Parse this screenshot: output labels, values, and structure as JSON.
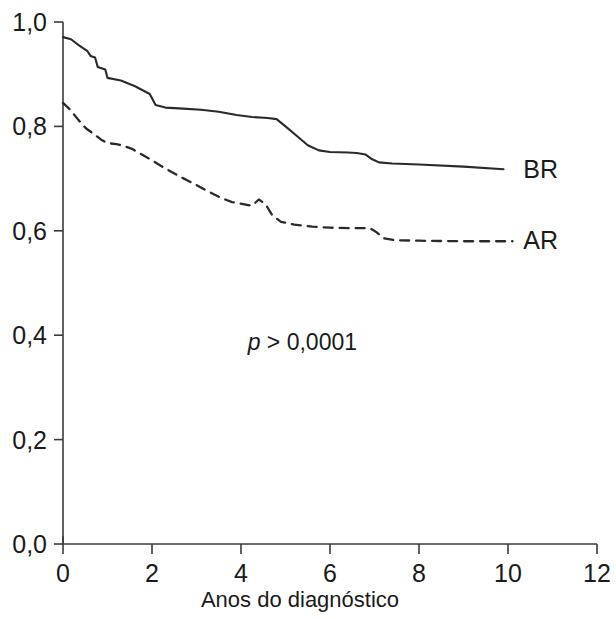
{
  "chart_data": {
    "type": "line",
    "title": "",
    "subtitle": "",
    "xlabel": "Anos do diagnóstico",
    "ylabel": "",
    "xlim": [
      0,
      12
    ],
    "ylim": [
      0.0,
      1.0
    ],
    "grid": false,
    "legend_position": "right-of-curve-end",
    "xticks": [
      0,
      2,
      4,
      6,
      8,
      10,
      12
    ],
    "xtick_labels": [
      "0",
      "2",
      "4",
      "6",
      "8",
      "10",
      "12"
    ],
    "yticks": [
      0.0,
      0.2,
      0.4,
      0.6,
      0.8,
      1.0
    ],
    "ytick_labels": [
      "0,0",
      "0,2",
      "0,4",
      "0,6",
      "0,8",
      "1,0"
    ],
    "annotations": [
      {
        "name": "p-value",
        "italic_prefix": "p",
        "text": " > 0,0001",
        "full_text": "p > 0,0001",
        "x": 4.15,
        "y": 0.372
      }
    ],
    "series": [
      {
        "name": "BR",
        "label": "BR",
        "style": "solid",
        "color": "#2a2a2a",
        "label_x": 10.05,
        "label_y": 0.718,
        "points": [
          [
            0.0,
            0.971
          ],
          [
            0.18,
            0.967
          ],
          [
            0.36,
            0.955
          ],
          [
            0.55,
            0.944
          ],
          [
            0.62,
            0.935
          ],
          [
            0.72,
            0.932
          ],
          [
            0.78,
            0.914
          ],
          [
            0.95,
            0.909
          ],
          [
            1.0,
            0.893
          ],
          [
            1.3,
            0.888
          ],
          [
            1.62,
            0.877
          ],
          [
            1.95,
            0.862
          ],
          [
            2.08,
            0.841
          ],
          [
            2.3,
            0.836
          ],
          [
            2.7,
            0.834
          ],
          [
            3.1,
            0.832
          ],
          [
            3.5,
            0.828
          ],
          [
            3.9,
            0.822
          ],
          [
            4.25,
            0.818
          ],
          [
            4.6,
            0.816
          ],
          [
            4.8,
            0.814
          ],
          [
            5.0,
            0.8
          ],
          [
            5.25,
            0.782
          ],
          [
            5.5,
            0.764
          ],
          [
            5.75,
            0.754
          ],
          [
            6.0,
            0.751
          ],
          [
            6.4,
            0.75
          ],
          [
            6.6,
            0.749
          ],
          [
            6.8,
            0.746
          ],
          [
            6.95,
            0.737
          ],
          [
            7.1,
            0.731
          ],
          [
            7.4,
            0.729
          ],
          [
            8.0,
            0.727
          ],
          [
            9.0,
            0.723
          ],
          [
            9.9,
            0.718
          ]
        ]
      },
      {
        "name": "AR",
        "label": "AR",
        "style": "dashed",
        "color": "#2a2a2a",
        "label_x": 10.05,
        "label_y": 0.582,
        "points": [
          [
            0.0,
            0.845
          ],
          [
            0.15,
            0.833
          ],
          [
            0.35,
            0.812
          ],
          [
            0.52,
            0.796
          ],
          [
            0.7,
            0.785
          ],
          [
            0.85,
            0.775
          ],
          [
            1.0,
            0.768
          ],
          [
            1.2,
            0.766
          ],
          [
            1.35,
            0.763
          ],
          [
            1.55,
            0.757
          ],
          [
            1.9,
            0.74
          ],
          [
            2.25,
            0.722
          ],
          [
            2.6,
            0.705
          ],
          [
            2.95,
            0.69
          ],
          [
            3.25,
            0.676
          ],
          [
            3.55,
            0.663
          ],
          [
            3.8,
            0.655
          ],
          [
            4.05,
            0.651
          ],
          [
            4.25,
            0.648
          ],
          [
            4.4,
            0.66
          ],
          [
            4.55,
            0.651
          ],
          [
            4.7,
            0.63
          ],
          [
            4.9,
            0.617
          ],
          [
            5.2,
            0.612
          ],
          [
            5.6,
            0.608
          ],
          [
            6.0,
            0.606
          ],
          [
            6.5,
            0.605
          ],
          [
            6.9,
            0.605
          ],
          [
            7.05,
            0.597
          ],
          [
            7.2,
            0.586
          ],
          [
            7.45,
            0.582
          ],
          [
            8.0,
            0.581
          ],
          [
            9.0,
            0.58
          ],
          [
            10.1,
            0.58
          ]
        ]
      }
    ]
  },
  "axis": {
    "xlabel": "Anos do diagnóstico"
  }
}
